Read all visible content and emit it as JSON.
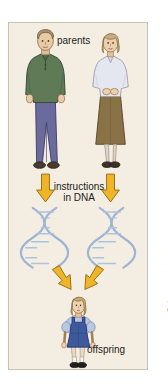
{
  "figure": {
    "panel": {
      "background_color": "#f4eee2",
      "border_color": "#c8c2b4"
    },
    "labels": {
      "parents": "parents",
      "instructions_line1": "instructions",
      "instructions_line2": "in DNA",
      "offspring": "offspring"
    },
    "copyright": "© Cengage Learning",
    "figures": {
      "father": {
        "name": "father",
        "hair_color": "#a98f6d",
        "skin_color": "#e8c9a8",
        "shirt_color": "#5e7a57",
        "pants_color": "#6a6a9c",
        "shoes_color": "#4a3a2c"
      },
      "mother": {
        "name": "mother",
        "hair_color": "#c9ad7f",
        "skin_color": "#ecd0ae",
        "blouse_color": "#e4e6f0",
        "skirt_color": "#8a7247",
        "shoes_color": "#3a3028"
      },
      "child": {
        "name": "child",
        "hair_color": "#c9a96f",
        "skin_color": "#edd2b2",
        "shirt_color": "#b9c7e2",
        "jumper_color": "#3f5a9c",
        "shoes_color": "#22201e"
      }
    },
    "arrows": {
      "color": "#f0b429",
      "outline_color": "#9a6f13",
      "count_down": 2,
      "count_converging": 2
    },
    "dna": {
      "color": "#9db4d4",
      "helix_count": 2,
      "description": "two light blue DNA double helices"
    }
  }
}
